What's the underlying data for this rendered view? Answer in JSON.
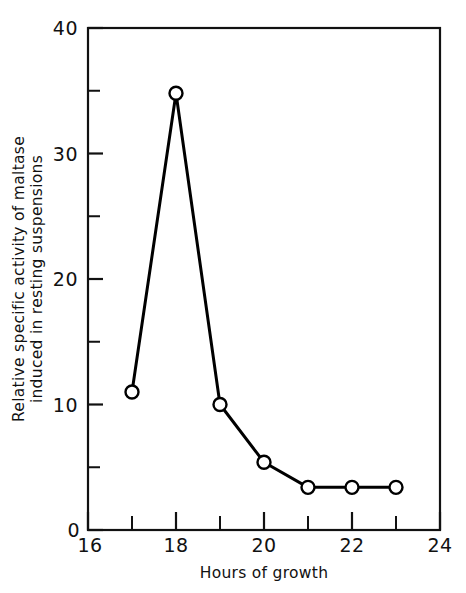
{
  "chart_data": {
    "type": "line",
    "title": "",
    "subtitle": "",
    "xlabel": "Hours of growth",
    "ylabel": "Relative specific activity of maltase induced in resting suspensions",
    "ylabel_lines": [
      "Relative specific activity of maltase",
      "induced in resting suspensions"
    ],
    "x": [
      17,
      18,
      19,
      20,
      21,
      22,
      23
    ],
    "values": [
      11,
      34.8,
      10,
      5.4,
      3.4,
      3.4,
      3.4
    ],
    "series": [
      {
        "name": "Relative specific activity of maltase",
        "x": [
          17,
          18,
          19,
          20,
          21,
          22,
          23
        ],
        "values": [
          11,
          34.8,
          10,
          5.4,
          3.4,
          3.4,
          3.4
        ]
      }
    ],
    "xlim": [
      16,
      24
    ],
    "ylim": [
      0,
      40
    ],
    "x_major_ticks": [
      16,
      18,
      20,
      22,
      24
    ],
    "x_minor_ticks": [
      17,
      19,
      21,
      23
    ],
    "y_major_ticks": [
      0,
      10,
      20,
      30,
      40
    ],
    "y_minor_ticks": [
      5,
      15,
      25,
      35
    ],
    "x_tick_labels": [
      "16",
      "18",
      "20",
      "22",
      "24"
    ],
    "y_tick_labels": [
      "0",
      "10",
      "20",
      "30",
      "40"
    ],
    "grid": false,
    "legend": false,
    "legend_position": "none",
    "marker": "open-circle",
    "line_color": "#000000",
    "marker_face_color": "#ffffff",
    "marker_edge_color": "#000000",
    "frame": "box"
  }
}
